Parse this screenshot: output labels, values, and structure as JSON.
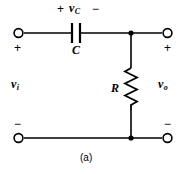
{
  "figure": {
    "caption": "(a)",
    "stroke_color": "#000000",
    "background_color": "#ffffff"
  },
  "labels": {
    "capacitor_voltage": "v",
    "capacitor_voltage_subscript": "C",
    "capacitor_polarity_left": "+",
    "capacitor_polarity_right": "−",
    "capacitor_name": "C",
    "resistor_name": "R",
    "input_voltage": "v",
    "input_voltage_subscript": "i",
    "output_voltage": "v",
    "output_voltage_subscript": "o",
    "input_terminal_plus": "+",
    "input_terminal_minus": "−",
    "output_terminal_plus": "+",
    "output_terminal_minus": "−"
  },
  "components": [
    {
      "type": "capacitor",
      "name": "C",
      "orientation": "horizontal",
      "branch": "series-top"
    },
    {
      "type": "resistor",
      "name": "R",
      "orientation": "vertical",
      "branch": "shunt"
    }
  ],
  "terminals": [
    {
      "name": "input-positive",
      "polarity": "+",
      "position": "top-left"
    },
    {
      "name": "input-negative",
      "polarity": "−",
      "position": "bottom-left"
    },
    {
      "name": "output-positive",
      "polarity": "+",
      "position": "top-right"
    },
    {
      "name": "output-negative",
      "polarity": "−",
      "position": "bottom-right"
    }
  ]
}
